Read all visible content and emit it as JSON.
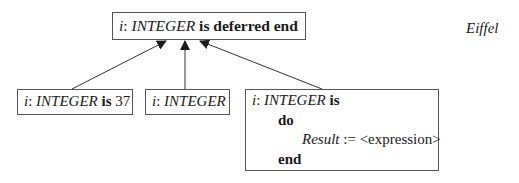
{
  "diagram": {
    "parent": {
      "name_i": "i",
      "colon": ": ",
      "type": "INTEGER",
      "rest": " is deferred end"
    },
    "children": [
      {
        "name_i": "i",
        "colon": ": ",
        "type": "INTEGER",
        "kw": " is",
        "value": " 37"
      },
      {
        "name_i": "i",
        "colon": ": ",
        "type": "INTEGER"
      },
      {
        "name_i": "i",
        "colon": ": ",
        "type": "INTEGER",
        "kw": " is",
        "do": "do",
        "result": "Result",
        "assign": " := <expression>",
        "end": "end"
      }
    ],
    "language_label": "Eiffel"
  }
}
